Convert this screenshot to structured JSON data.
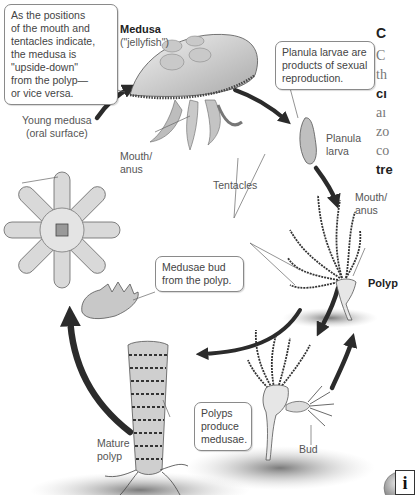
{
  "diagram": {
    "stages": {
      "medusa": {
        "title": "Medusa",
        "subtitle": "(\"jellyfish\")"
      },
      "planula": {
        "label_line1": "Planula",
        "label_line2": "larva"
      },
      "polyp": {
        "label": "Polyp"
      },
      "bud": {
        "label": "Bud"
      },
      "mature_polyp": {
        "label_line1": "Mature",
        "label_line2": "polyp"
      },
      "young_medusa": {
        "label_line1": "Young medusa",
        "label_line2": "(oral surface)"
      }
    },
    "labels": {
      "mouth_anus_medusa_1": "Mouth/",
      "mouth_anus_medusa_2": "anus",
      "mouth_anus_polyp_1": "Mouth/",
      "mouth_anus_polyp_2": "anus",
      "tentacles": "Tentacles"
    },
    "callouts": {
      "orientation": [
        "As the positions",
        "of the mouth and",
        "tentacles indicate,",
        "the medusa is",
        "\"upside-down\"",
        "from the polyp—",
        "or vice versa."
      ],
      "planula": [
        "Planula larvae are",
        "products of sexual",
        "reproduction."
      ],
      "medusae_bud": [
        "Medusae bud",
        "from the polyp."
      ],
      "polyps_produce": [
        "Polyps",
        "produce",
        "medusae."
      ]
    },
    "colors": {
      "arrow": "#2b2b2b",
      "callout_border": "#8a8a8a",
      "text": "#555555",
      "ground": "#9a9a9a"
    }
  },
  "side_panel": {
    "heading": "C",
    "lines": [
      "C",
      "th",
      "cı",
      "aı",
      "zo",
      "co",
      "tre"
    ]
  },
  "info_button": {
    "glyph": "i"
  }
}
